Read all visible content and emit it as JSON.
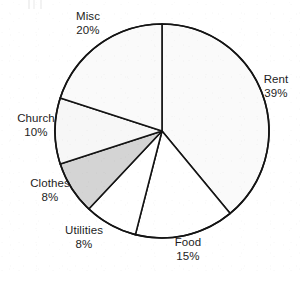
{
  "chart_data": {
    "type": "pie",
    "title": "",
    "subtitle": "",
    "xlabel": "",
    "ylabel": "",
    "legend_position": "none",
    "grid": false,
    "label_format": "name and percent, two lines, outside slice",
    "start_angle_deg": 0,
    "direction": "clockwise",
    "total_percent": 100,
    "categories": [
      "Rent",
      "Food",
      "Utilities",
      "Clothes",
      "Church",
      "Misc"
    ],
    "values": [
      39,
      15,
      8,
      8,
      10,
      20
    ],
    "slices": [
      {
        "name": "Rent",
        "percent": 39,
        "percent_text": "39%",
        "fill": "#fafafa",
        "stroke": "#141414",
        "shaded": false
      },
      {
        "name": "Food",
        "percent": 15,
        "percent_text": "15%",
        "fill": "#ffffff",
        "stroke": "#141414",
        "shaded": false
      },
      {
        "name": "Utilities",
        "percent": 8,
        "percent_text": "8%",
        "fill": "#ffffff",
        "stroke": "#141414",
        "shaded": false
      },
      {
        "name": "Clothes",
        "percent": 8,
        "percent_text": "8%",
        "fill": "#d4d4d4",
        "stroke": "#141414",
        "shaded": true
      },
      {
        "name": "Church",
        "percent": 10,
        "percent_text": "10%",
        "fill": "#f7f7f7",
        "stroke": "#141414",
        "shaded": false
      },
      {
        "name": "Misc",
        "percent": 20,
        "percent_text": "20%",
        "fill": "#fafafa",
        "stroke": "#141414",
        "shaded": false
      }
    ],
    "geometry": {
      "center_x": 162,
      "center_y": 131,
      "radius": 107,
      "stroke_width": 1.6
    }
  },
  "labels": {
    "misc": {
      "name": "Misc",
      "percent": "20%"
    },
    "rent": {
      "name": "Rent",
      "percent": "39%"
    },
    "food": {
      "name": "Food",
      "percent": "15%"
    },
    "utilities": {
      "name": "Utilities",
      "percent": "8%"
    },
    "clothes": {
      "name": "Clothes",
      "percent": "8%"
    },
    "church": {
      "name": "Church",
      "percent": "10%"
    }
  },
  "colors": {
    "outline": "#141414",
    "slice_light": "#fafafa",
    "slice_white": "#ffffff",
    "slice_shaded": "#d4d4d4",
    "text": "#1d1d1d",
    "background": "#ffffff"
  }
}
